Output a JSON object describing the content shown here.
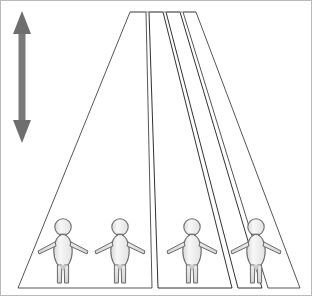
{
  "image": {
    "title": "Ponzo-style perspective corridor with four identical human figures",
    "width": 312,
    "height": 296,
    "background_color": "#ffffff",
    "border_color": "#b9b9b9"
  },
  "reference_arrow": {
    "name": "vertical-double-headed-arrow",
    "orientation": "vertical",
    "heads": "both",
    "color": "#6e6e6e",
    "shaft_color": "#7a7a7a",
    "x_center": 22,
    "y_top": 12,
    "y_bottom": 142,
    "length_px": 130,
    "label": ""
  },
  "corridor": {
    "name": "perspective-lanes",
    "lane_count": 4,
    "vanishing_top_y": 12,
    "baseline_y": 288,
    "top_left_x": 130,
    "top_right_x": 196,
    "stroke_color": "#2b2b2b",
    "fill_color": "#ffffff",
    "lanes": [
      {
        "index": 1,
        "name": "lane-1",
        "top_left_x": 130,
        "top_right_x": 146,
        "bottom_left_x": 18,
        "bottom_right_x": 152
      },
      {
        "index": 2,
        "name": "lane-2",
        "top_left_x": 149,
        "top_right_x": 163,
        "bottom_left_x": 158,
        "bottom_right_x": 232
      },
      {
        "index": 3,
        "name": "lane-3",
        "top_left_x": 166,
        "top_right_x": 180,
        "bottom_left_x": 238,
        "bottom_right_x": 262
      },
      {
        "index": 4,
        "name": "lane-4",
        "top_left_x": 183,
        "top_right_x": 196,
        "bottom_left_x": 268,
        "bottom_right_x": 300
      }
    ]
  },
  "figures": {
    "name": "human-figures",
    "count": 4,
    "all_same_size": true,
    "height_px": 66,
    "fill_color": "#f2f2f2",
    "outline_color": "#6a6a6a",
    "items": [
      {
        "index": 1,
        "name": "figure-1",
        "cx": 63,
        "base_y": 284,
        "scale": 1.0,
        "lane": 1
      },
      {
        "index": 2,
        "name": "figure-2",
        "cx": 120,
        "base_y": 284,
        "scale": 1.0,
        "lane": 2
      },
      {
        "index": 3,
        "name": "figure-3",
        "cx": 192,
        "base_y": 284,
        "scale": 1.0,
        "lane": 3
      },
      {
        "index": 4,
        "name": "figure-4",
        "cx": 256,
        "base_y": 284,
        "scale": 1.0,
        "lane": 4
      }
    ]
  },
  "chart_data": {
    "type": "diagram",
    "annotations": [],
    "legend": []
  }
}
